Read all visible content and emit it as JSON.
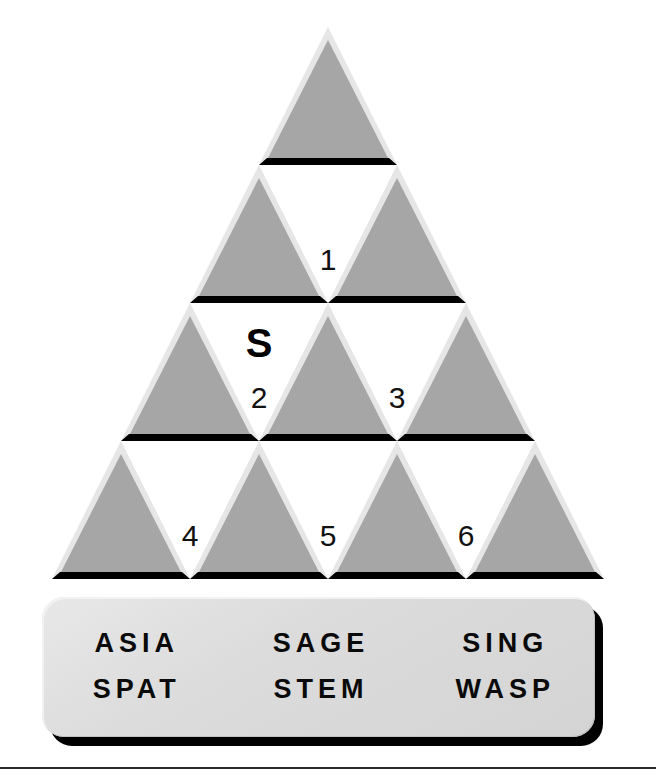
{
  "puzzle": {
    "type": "triangle-pyramid-word-puzzle",
    "rows": 4,
    "colors": {
      "triangle_fill": "#a6a6a6",
      "triangle_highlight": "#e6e6e6",
      "triangle_shadow": "#000000",
      "cell_background": "#ffffff",
      "word_bank_background": "#dcdcdc",
      "text": "#111111",
      "page_background": "#ffffff"
    },
    "pyramid": {
      "up_triangles": [
        {
          "row": 1,
          "index": 1,
          "label": ""
        },
        {
          "row": 2,
          "index": 1,
          "label": ""
        },
        {
          "row": 2,
          "index": 2,
          "label": ""
        },
        {
          "row": 3,
          "index": 1,
          "label": ""
        },
        {
          "row": 3,
          "index": 2,
          "label": ""
        },
        {
          "row": 3,
          "index": 3,
          "label": ""
        },
        {
          "row": 4,
          "index": 1,
          "label": ""
        },
        {
          "row": 4,
          "index": 2,
          "label": ""
        },
        {
          "row": 4,
          "index": 3,
          "label": ""
        },
        {
          "row": 4,
          "index": 4,
          "label": ""
        }
      ],
      "down_cells": [
        {
          "row": 2,
          "index": 1,
          "number": "1",
          "letter": ""
        },
        {
          "row": 3,
          "index": 1,
          "number": "2",
          "letter": "S"
        },
        {
          "row": 3,
          "index": 2,
          "number": "3",
          "letter": ""
        },
        {
          "row": 4,
          "index": 1,
          "number": "4",
          "letter": ""
        },
        {
          "row": 4,
          "index": 2,
          "number": "5",
          "letter": ""
        },
        {
          "row": 4,
          "index": 3,
          "number": "6",
          "letter": ""
        }
      ]
    },
    "word_bank": {
      "rows": [
        [
          "ASIA",
          "SAGE",
          "SING"
        ],
        [
          "SPAT",
          "STEM",
          "WASP"
        ]
      ]
    }
  }
}
